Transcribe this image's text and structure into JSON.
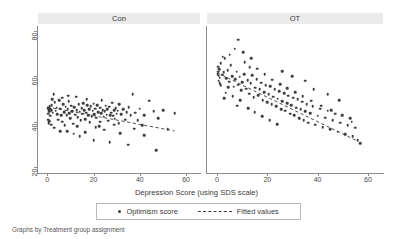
{
  "chart_data": {
    "type": "scatter",
    "title": "",
    "xlabel": "Depression Score (using SDS scale)",
    "ylabel": "",
    "xlim": [
      -4,
      66
    ],
    "ylim": [
      18,
      82
    ],
    "xticks": [
      0,
      20,
      40,
      60
    ],
    "yticks": [
      20,
      40,
      60,
      80
    ],
    "grid": false,
    "legend_position": "bottom-center",
    "panel_variable": "Treatment group assignment",
    "legend": [
      {
        "label": "Optimism score",
        "marker": "dot",
        "color": "#3f3f3f"
      },
      {
        "label": "Fitted values",
        "marker": "dashed-line",
        "color": "#3a3a3a"
      }
    ],
    "panels": [
      {
        "name": "Con",
        "fit": {
          "x0": 0,
          "y0": 46.5,
          "x1": 55,
          "y1": 36.0
        },
        "points": [
          [
            0.4,
            46.0
          ],
          [
            0.6,
            45.2
          ],
          [
            0.8,
            44.4
          ],
          [
            1.0,
            46.8
          ],
          [
            1.2,
            45.6
          ],
          [
            0.5,
            43.6
          ],
          [
            1.6,
            45.0
          ],
          [
            2.0,
            47.2
          ],
          [
            2.4,
            44.0
          ],
          [
            0.3,
            41.0
          ],
          [
            0.9,
            40.2
          ],
          [
            1.4,
            42.6
          ],
          [
            2.8,
            52.0
          ],
          [
            3.2,
            48.6
          ],
          [
            3.6,
            44.8
          ],
          [
            4.0,
            46.2
          ],
          [
            4.4,
            43.4
          ],
          [
            4.8,
            41.0
          ],
          [
            5.2,
            49.4
          ],
          [
            5.6,
            45.8
          ],
          [
            6.0,
            43.0
          ],
          [
            6.4,
            40.0
          ],
          [
            6.8,
            47.6
          ],
          [
            7.2,
            44.2
          ],
          [
            7.6,
            38.6
          ],
          [
            8.0,
            46.6
          ],
          [
            8.4,
            42.8
          ],
          [
            8.8,
            45.4
          ],
          [
            9.2,
            49.0
          ],
          [
            9.6,
            43.8
          ],
          [
            10.0,
            41.6
          ],
          [
            10.4,
            47.0
          ],
          [
            10.8,
            44.6
          ],
          [
            11.2,
            39.2
          ],
          [
            11.6,
            46.4
          ],
          [
            12.0,
            43.2
          ],
          [
            12.4,
            51.0
          ],
          [
            12.8,
            45.0
          ],
          [
            13.2,
            42.0
          ],
          [
            13.6,
            47.8
          ],
          [
            14.0,
            44.4
          ],
          [
            14.4,
            40.6
          ],
          [
            14.8,
            46.0
          ],
          [
            15.2,
            43.6
          ],
          [
            15.6,
            48.2
          ],
          [
            16.0,
            45.2
          ],
          [
            16.4,
            41.2
          ],
          [
            16.8,
            44.0
          ],
          [
            17.2,
            47.4
          ],
          [
            17.6,
            43.0
          ],
          [
            18.0,
            45.6
          ],
          [
            18.4,
            39.8
          ],
          [
            18.8,
            46.8
          ],
          [
            19.2,
            42.4
          ],
          [
            19.6,
            44.8
          ],
          [
            20.0,
            48.0
          ],
          [
            20.4,
            43.4
          ],
          [
            20.8,
            45.8
          ],
          [
            21.2,
            41.8
          ],
          [
            21.6,
            47.2
          ],
          [
            22.0,
            44.2
          ],
          [
            22.4,
            38.0
          ],
          [
            22.8,
            46.2
          ],
          [
            23.2,
            43.8
          ],
          [
            23.6,
            49.6
          ],
          [
            24.0,
            45.0
          ],
          [
            24.4,
            42.2
          ],
          [
            24.8,
            44.6
          ],
          [
            25.2,
            47.0
          ],
          [
            25.6,
            43.2
          ],
          [
            26.0,
            45.4
          ],
          [
            26.4,
            40.4
          ],
          [
            26.8,
            46.6
          ],
          [
            27.2,
            43.0
          ],
          [
            27.6,
            44.0
          ],
          [
            28.0,
            48.4
          ],
          [
            28.4,
            42.6
          ],
          [
            28.8,
            45.2
          ],
          [
            29.2,
            41.4
          ],
          [
            29.6,
            46.0
          ],
          [
            30.0,
            43.6
          ],
          [
            30.4,
            44.8
          ],
          [
            30.8,
            39.4
          ],
          [
            31.2,
            47.6
          ],
          [
            32.0,
            43.4
          ],
          [
            32.8,
            45.6
          ],
          [
            33.6,
            41.0
          ],
          [
            34.4,
            44.2
          ],
          [
            35.2,
            46.4
          ],
          [
            36.0,
            42.8
          ],
          [
            37.0,
            52.2
          ],
          [
            38.0,
            44.0
          ],
          [
            39.0,
            40.8
          ],
          [
            40.0,
            45.8
          ],
          [
            41.0,
            38.4
          ],
          [
            42.0,
            43.0
          ],
          [
            44.0,
            49.2
          ],
          [
            46.0,
            44.6
          ],
          [
            48.0,
            41.6
          ],
          [
            50.0,
            45.0
          ],
          [
            52.0,
            36.8
          ],
          [
            55.0,
            43.8
          ],
          [
            14.0,
            33.6
          ],
          [
            20.0,
            32.0
          ],
          [
            27.0,
            31.0
          ],
          [
            35.0,
            30.0
          ],
          [
            42.0,
            34.2
          ],
          [
            47.0,
            27.6
          ],
          [
            8.5,
            36.0
          ],
          [
            11.5,
            34.8
          ],
          [
            16.5,
            35.4
          ],
          [
            24.5,
            36.6
          ],
          [
            31.5,
            35.0
          ],
          [
            37.5,
            37.0
          ],
          [
            3.0,
            37.4
          ],
          [
            5.5,
            35.8
          ],
          [
            1.8,
            38.8
          ],
          [
            0.7,
            39.4
          ],
          [
            13.0,
            38.2
          ],
          [
            21.0,
            37.6
          ],
          [
            6.5,
            50.6
          ],
          [
            9.0,
            51.4
          ],
          [
            17.0,
            50.0
          ],
          [
            2.2,
            49.8
          ],
          [
            23.0,
            40.0
          ],
          [
            29.0,
            38.8
          ]
        ]
      },
      {
        "name": "OT",
        "fit": {
          "x0": 0,
          "y0": 61.5,
          "x1": 56,
          "y1": 31.5
        },
        "points": [
          [
            0.3,
            61.0
          ],
          [
            0.5,
            62.0
          ],
          [
            0.7,
            60.2
          ],
          [
            0.9,
            63.0
          ],
          [
            1.1,
            59.4
          ],
          [
            0.4,
            64.2
          ],
          [
            1.5,
            65.8
          ],
          [
            2.0,
            60.6
          ],
          [
            0.6,
            58.0
          ],
          [
            1.0,
            57.0
          ],
          [
            1.4,
            56.0
          ],
          [
            2.6,
            61.8
          ],
          [
            3.0,
            67.8
          ],
          [
            3.6,
            59.0
          ],
          [
            4.2,
            62.6
          ],
          [
            4.8,
            57.6
          ],
          [
            5.4,
            64.8
          ],
          [
            6.0,
            60.0
          ],
          [
            6.6,
            55.4
          ],
          [
            7.2,
            58.6
          ],
          [
            7.8,
            62.0
          ],
          [
            8.4,
            56.2
          ],
          [
            9.0,
            59.8
          ],
          [
            9.6,
            53.8
          ],
          [
            7.0,
            72.0
          ],
          [
            8.5,
            76.0
          ],
          [
            10.5,
            70.4
          ],
          [
            11.0,
            66.2
          ],
          [
            10.0,
            57.4
          ],
          [
            10.8,
            61.0
          ],
          [
            11.6,
            54.6
          ],
          [
            12.2,
            58.2
          ],
          [
            12.8,
            52.4
          ],
          [
            13.4,
            56.8
          ],
          [
            14.0,
            60.4
          ],
          [
            14.6,
            50.8
          ],
          [
            15.2,
            55.0
          ],
          [
            15.8,
            58.8
          ],
          [
            16.4,
            51.6
          ],
          [
            17.0,
            54.2
          ],
          [
            17.6,
            57.2
          ],
          [
            18.2,
            49.4
          ],
          [
            18.8,
            53.0
          ],
          [
            19.4,
            56.0
          ],
          [
            20.0,
            48.6
          ],
          [
            20.6,
            52.2
          ],
          [
            21.2,
            55.6
          ],
          [
            21.8,
            47.8
          ],
          [
            22.4,
            51.0
          ],
          [
            23.0,
            54.4
          ],
          [
            23.6,
            46.8
          ],
          [
            24.2,
            50.2
          ],
          [
            24.8,
            53.4
          ],
          [
            25.4,
            45.6
          ],
          [
            26.0,
            49.0
          ],
          [
            26.6,
            52.6
          ],
          [
            27.2,
            44.8
          ],
          [
            27.8,
            48.2
          ],
          [
            28.4,
            51.4
          ],
          [
            29.0,
            43.6
          ],
          [
            29.6,
            47.4
          ],
          [
            30.2,
            50.6
          ],
          [
            30.8,
            42.8
          ],
          [
            31.4,
            46.2
          ],
          [
            32.0,
            49.8
          ],
          [
            32.6,
            41.6
          ],
          [
            33.2,
            45.4
          ],
          [
            33.8,
            48.8
          ],
          [
            34.4,
            40.8
          ],
          [
            35.0,
            44.6
          ],
          [
            35.6,
            47.8
          ],
          [
            36.2,
            39.6
          ],
          [
            37.0,
            43.8
          ],
          [
            38.0,
            46.8
          ],
          [
            39.0,
            38.8
          ],
          [
            40.0,
            42.6
          ],
          [
            41.0,
            45.8
          ],
          [
            42.0,
            37.6
          ],
          [
            43.0,
            41.8
          ],
          [
            44.0,
            44.8
          ],
          [
            45.0,
            36.8
          ],
          [
            46.0,
            40.6
          ],
          [
            47.0,
            43.6
          ],
          [
            48.0,
            35.6
          ],
          [
            49.0,
            39.6
          ],
          [
            50.0,
            42.8
          ],
          [
            51.0,
            34.6
          ],
          [
            52.0,
            38.4
          ],
          [
            53.0,
            41.6
          ],
          [
            54.0,
            33.6
          ],
          [
            55.0,
            37.4
          ],
          [
            56.0,
            32.0
          ],
          [
            57.0,
            30.6
          ],
          [
            2.2,
            68.6
          ],
          [
            5.0,
            69.4
          ],
          [
            13.0,
            64.0
          ],
          [
            16.0,
            63.2
          ],
          [
            19.0,
            60.8
          ],
          [
            22.0,
            58.4
          ],
          [
            25.0,
            56.6
          ],
          [
            28.0,
            54.8
          ],
          [
            31.0,
            53.0
          ],
          [
            34.0,
            51.2
          ],
          [
            37.5,
            49.2
          ],
          [
            41.5,
            47.0
          ],
          [
            45.5,
            45.0
          ],
          [
            49.5,
            43.0
          ],
          [
            53.5,
            40.0
          ],
          [
            6.2,
            51.2
          ],
          [
            9.2,
            49.6
          ],
          [
            12.5,
            46.0
          ],
          [
            15.0,
            44.2
          ],
          [
            18.0,
            42.4
          ],
          [
            21.0,
            40.8
          ],
          [
            24.0,
            39.0
          ],
          [
            13.6,
            68.0
          ],
          [
            4.4,
            55.2
          ],
          [
            3.4,
            52.8
          ],
          [
            2.8,
            50.4
          ],
          [
            8.0,
            47.0
          ],
          [
            35.0,
            58.0
          ],
          [
            30.0,
            60.0
          ],
          [
            26.0,
            62.2
          ],
          [
            44.0,
            52.0
          ],
          [
            38.5,
            54.2
          ],
          [
            48.5,
            49.4
          ]
        ]
      }
    ]
  },
  "footnote": "Graphs by Treatment group assignment"
}
